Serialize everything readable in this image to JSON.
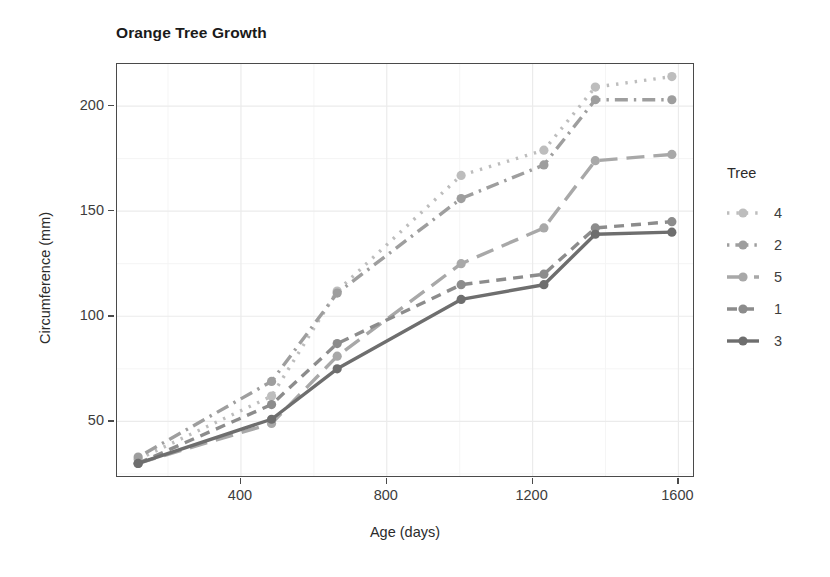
{
  "chart_data": {
    "type": "line",
    "title": "Orange Tree Growth",
    "xlabel": "Age (days)",
    "ylabel": "Circumference (mm)",
    "x": [
      118,
      484,
      664,
      1004,
      1231,
      1372,
      1582
    ],
    "xlim": [
      60,
      1640
    ],
    "ylim": [
      24,
      220
    ],
    "xticks": [
      400,
      800,
      1200,
      1600
    ],
    "xtick_labels": [
      "400",
      "800",
      "1200",
      "1600"
    ],
    "yticks": [
      50,
      100,
      150,
      200
    ],
    "ytick_labels": [
      "50",
      "100",
      "150",
      "200"
    ],
    "grid": true,
    "legend_position": "right",
    "legend_title": "Tree",
    "series": [
      {
        "name": "4",
        "label": "4",
        "values": [
          32,
          62,
          112,
          167,
          179,
          209,
          214
        ],
        "color": "#bdbdbd",
        "dash": "dotted",
        "linetype": "dotted"
      },
      {
        "name": "2",
        "label": "2",
        "values": [
          33,
          69,
          111,
          156,
          172,
          203,
          203
        ],
        "color": "#9e9e9e",
        "dash": "dotdash",
        "linetype": "dotdash"
      },
      {
        "name": "5",
        "label": "5",
        "values": [
          30,
          49,
          81,
          125,
          142,
          174,
          177
        ],
        "color": "#a8a8a8",
        "dash": "longdash",
        "linetype": "longdash"
      },
      {
        "name": "1",
        "label": "1",
        "values": [
          30,
          58,
          87,
          115,
          120,
          142,
          145
        ],
        "color": "#8c8c8c",
        "dash": "dashed",
        "linetype": "dashed"
      },
      {
        "name": "3",
        "label": "3",
        "values": [
          30,
          51,
          75,
          108,
          115,
          139,
          140
        ],
        "color": "#6e6e6e",
        "dash": "solid",
        "linetype": "solid"
      }
    ]
  },
  "theme": {
    "panel_border": "#4a4a4a",
    "grid_color": "#ebebeb",
    "text_color": "#3d3d3d",
    "title_color": "#1a1a1a",
    "background": "#ffffff"
  }
}
